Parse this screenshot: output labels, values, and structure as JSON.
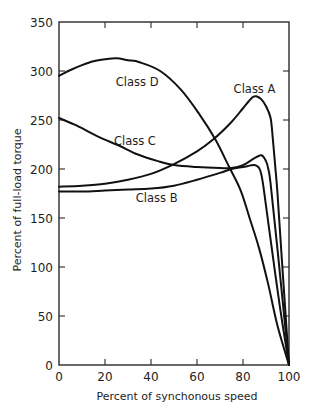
{
  "chart_data": {
    "type": "line",
    "title": "",
    "xlabel": "Percent of synchonous speed",
    "ylabel": "Percent of full-load torque",
    "xlim": [
      0,
      100
    ],
    "ylim": [
      0,
      350
    ],
    "xticks": [
      0,
      20,
      40,
      60,
      80,
      100
    ],
    "yticks": [
      0,
      50,
      100,
      150,
      200,
      250,
      300,
      350
    ],
    "grid": false,
    "legend": "none (curves labeled inline)",
    "series": [
      {
        "name": "Class A",
        "label_pos": [
          85,
          282
        ],
        "points": [
          [
            0,
            182
          ],
          [
            10,
            183
          ],
          [
            20,
            185
          ],
          [
            30,
            189
          ],
          [
            40,
            195
          ],
          [
            50,
            205
          ],
          [
            60,
            218
          ],
          [
            67,
            230
          ],
          [
            75,
            248
          ],
          [
            80,
            262
          ],
          [
            84,
            273
          ],
          [
            86,
            274
          ],
          [
            88,
            271
          ],
          [
            90,
            264
          ],
          [
            92,
            252
          ],
          [
            93,
            230
          ],
          [
            94,
            203
          ],
          [
            95,
            175
          ],
          [
            97,
            104
          ],
          [
            100,
            0
          ]
        ]
      },
      {
        "name": "Class B",
        "label_pos": [
          42.5,
          170
        ],
        "points": [
          [
            0,
            177
          ],
          [
            10,
            177
          ],
          [
            20,
            178
          ],
          [
            30,
            179
          ],
          [
            40,
            180
          ],
          [
            50,
            183
          ],
          [
            60,
            189
          ],
          [
            70,
            196
          ],
          [
            75,
            200
          ],
          [
            80,
            202
          ],
          [
            85,
            204
          ],
          [
            87,
            201
          ],
          [
            88,
            194
          ],
          [
            89,
            180
          ],
          [
            92,
            128
          ],
          [
            96,
            60
          ],
          [
            100,
            0
          ]
        ]
      },
      {
        "name": "Class C",
        "label_pos": [
          33,
          229
        ],
        "points": [
          [
            0,
            252
          ],
          [
            8,
            244
          ],
          [
            17,
            233
          ],
          [
            26,
            224
          ],
          [
            34,
            215
          ],
          [
            43,
            208
          ],
          [
            50,
            204
          ],
          [
            60,
            202
          ],
          [
            70,
            201
          ],
          [
            75,
            201
          ],
          [
            80,
            204
          ],
          [
            85,
            211
          ],
          [
            88,
            214
          ],
          [
            90,
            208
          ],
          [
            91,
            200
          ],
          [
            92,
            185
          ],
          [
            95,
            118
          ],
          [
            100,
            0
          ]
        ]
      },
      {
        "name": "Class D",
        "label_pos": [
          34,
          289
        ],
        "points": [
          [
            0,
            295
          ],
          [
            5,
            301
          ],
          [
            10,
            306
          ],
          [
            15,
            310
          ],
          [
            20,
            312
          ],
          [
            25,
            313
          ],
          [
            30,
            311
          ],
          [
            35,
            309
          ],
          [
            44,
            300
          ],
          [
            53,
            281
          ],
          [
            61,
            256
          ],
          [
            68,
            230
          ],
          [
            74,
            202
          ],
          [
            79,
            178
          ],
          [
            83,
            149
          ],
          [
            87,
            119
          ],
          [
            91,
            82
          ],
          [
            95,
            40
          ],
          [
            100,
            0
          ]
        ]
      }
    ]
  }
}
